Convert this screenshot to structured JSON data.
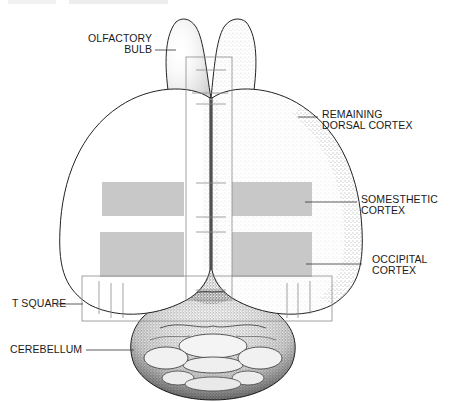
{
  "figure": {
    "colors": {
      "outline": "#222222",
      "stipple": "#555555",
      "region_fill": "#c8c8c8",
      "tsquare_line": "#8a8a8a",
      "leader_line": "#333333",
      "text": "#1a1a1a"
    }
  },
  "labels": {
    "olfactory_bulb": {
      "line1": "OLFACTORY",
      "line2": "BULB"
    },
    "remaining_dorsal_cortex": {
      "line1": "REMAINING",
      "line2": "DORSAL CORTEX"
    },
    "somesthetic_cortex": {
      "line1": "SOMESTHETIC",
      "line2": "CORTEX"
    },
    "occipital_cortex": {
      "line1": "OCCIPITAL",
      "line2": "CORTEX"
    },
    "t_square": {
      "line1": "T SQUARE"
    },
    "cerebellum": {
      "line1": "CEREBELLUM"
    }
  }
}
